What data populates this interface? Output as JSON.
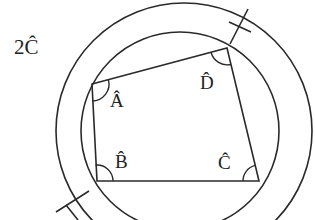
{
  "diagram": {
    "type": "geometry",
    "colors": {
      "stroke": "#2a2a2a",
      "text": "#222222",
      "background": "#ffffff"
    },
    "outer_label": "2Ĉ",
    "vertices": [
      {
        "id": "A",
        "label": "Â",
        "x": 92,
        "y": 84
      },
      {
        "id": "B",
        "label": "B̂",
        "x": 97,
        "y": 181
      },
      {
        "id": "C",
        "label": "Ĉ",
        "x": 259,
        "y": 181
      },
      {
        "id": "D",
        "label": "D̂",
        "x": 227,
        "y": 48
      }
    ],
    "angle_labels": {
      "A": "Â",
      "B": "B̂",
      "C": "Ĉ",
      "D": "D̂"
    },
    "circles": [
      {
        "name": "inner",
        "cx": 180,
        "cy": 131,
        "r": 99
      },
      {
        "name": "outer",
        "cx": 184,
        "cy": 131,
        "r": 128
      }
    ]
  }
}
